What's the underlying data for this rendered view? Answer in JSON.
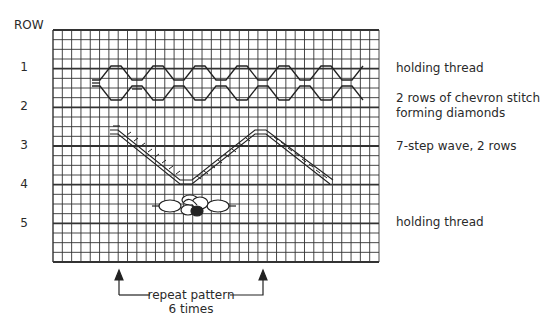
{
  "header": {
    "row_label": "ROW"
  },
  "rows": [
    {
      "num": "1",
      "y": 68,
      "description": "holding thread"
    },
    {
      "num": "2",
      "y": 106,
      "description": "2 rows of chevron stitch forming diamonds"
    },
    {
      "num": "3",
      "y": 145,
      "description": "7-step wave, 2 rows"
    },
    {
      "num": "4",
      "y": 184,
      "description": ""
    },
    {
      "num": "5",
      "y": 223,
      "description": "holding thread"
    }
  ],
  "labels": {
    "row1": "holding thread",
    "row2_line1": "2 rows of chevron stitch",
    "row2_line2": "forming diamonds",
    "row3": "7-step wave, 2 rows",
    "row5": "holding thread"
  },
  "repeat": {
    "line1": "repeat pattern",
    "line2": "6 times"
  },
  "grid": {
    "left": 53,
    "top": 30,
    "right": 379,
    "bottom": 262,
    "columns": 35,
    "rows": 24,
    "heavy_every": 4,
    "line_color": "#333333"
  }
}
